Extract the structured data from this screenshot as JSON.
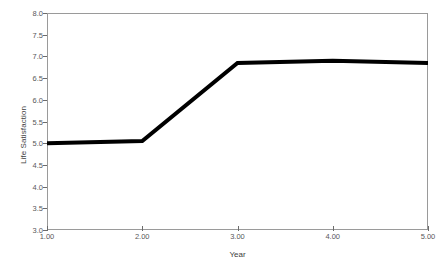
{
  "chart_data": {
    "type": "line",
    "title": "",
    "subtitle": "",
    "xlabel": "Year",
    "ylabel": "Life Satisfaction",
    "x": [
      1.0,
      2.0,
      3.0,
      4.0,
      5.0
    ],
    "values": [
      5.0,
      5.05,
      6.85,
      6.9,
      6.85
    ],
    "series": [
      {
        "name": "Life Satisfaction",
        "values": [
          5.0,
          5.05,
          6.85,
          6.9,
          6.85
        ]
      }
    ],
    "xtick_labels": [
      "1.00",
      "2.00",
      "3.00",
      "4.00",
      "5.00"
    ],
    "xtick_values": [
      1.0,
      2.0,
      3.0,
      4.0,
      5.0
    ],
    "ytick_labels": [
      "3.0",
      "3.5",
      "4.0",
      "4.5",
      "5.0",
      "5.5",
      "6.0",
      "6.5",
      "7.0",
      "7.5",
      "8.0"
    ],
    "ytick_values": [
      3.0,
      3.5,
      4.0,
      4.5,
      5.0,
      5.5,
      6.0,
      6.5,
      7.0,
      7.5,
      8.0
    ],
    "xlim": [
      1.0,
      5.0
    ],
    "ylim": [
      3.0,
      8.0
    ],
    "grid": false,
    "legend": false,
    "legend_position": "none",
    "line_color": "#000000",
    "line_width_px": 4,
    "axis_color": "#9a9a9a",
    "tick_color": "#6b6b6b",
    "text_color": "#58585a",
    "background_color": "#ffffff",
    "annotations": []
  }
}
